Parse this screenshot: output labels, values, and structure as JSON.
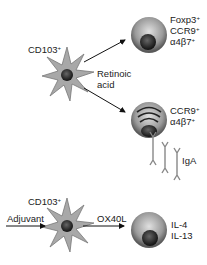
{
  "diagram": {
    "top_dc": {
      "label": "CD103",
      "sup": "+"
    },
    "top_arrow_label": [
      "Retinoic",
      "acid"
    ],
    "treg_cell": {
      "markers": [
        {
          "t": "Foxp3",
          "s": "+"
        },
        {
          "t": "CCR9",
          "s": "+"
        },
        {
          "t": "α4β7",
          "s": "+"
        }
      ]
    },
    "plasma_cell": {
      "markers": [
        {
          "t": "CCR9",
          "s": "+"
        },
        {
          "t": "α4β7",
          "s": "+"
        }
      ]
    },
    "antibody_label": "IgA",
    "bottom_dc": {
      "label": "CD103",
      "sup": "+"
    },
    "bottom_input_label": "Adjuvant",
    "bottom_arrow_label": "OX40L",
    "th2_cell": {
      "markers": [
        "IL-4",
        "IL-13"
      ]
    }
  },
  "colors": {
    "cell_body": "#9a9a9a",
    "nucleus": "#333333",
    "star": "#a8a8a8",
    "arrow": "#111111"
  }
}
